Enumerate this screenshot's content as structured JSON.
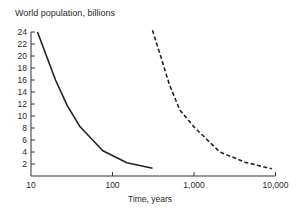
{
  "chart_data": {
    "type": "line",
    "title": "World population, billions",
    "xlabel": "Time, years",
    "ylabel": "World population, billions",
    "xscale": "log",
    "xlim": [
      10,
      10000
    ],
    "ylim": [
      0,
      24
    ],
    "xticks": [
      10,
      100,
      1000,
      10000
    ],
    "xtick_labels": [
      "10",
      "100",
      "1,000",
      "10,000"
    ],
    "yticks": [
      2,
      4,
      6,
      8,
      10,
      12,
      14,
      16,
      18,
      20,
      22,
      24
    ],
    "ytick_labels": [
      "2",
      "4",
      "6",
      "8",
      "10",
      "12",
      "14",
      "16",
      "18",
      "20",
      "22",
      "24"
    ],
    "grid": false,
    "legend": null,
    "series": [
      {
        "name": "solid",
        "style": "solid",
        "color": "#222222",
        "x": [
          12,
          20,
          28,
          40,
          76,
          150,
          310
        ],
        "y": [
          24,
          16,
          11.7,
          8.2,
          4.2,
          2.2,
          1.3
        ]
      },
      {
        "name": "dashed",
        "style": "dashed",
        "color": "#222222",
        "x": [
          310,
          500,
          670,
          1030,
          2080,
          4200,
          9000
        ],
        "y": [
          24.3,
          15.2,
          11,
          8,
          4,
          2.3,
          1.2
        ]
      }
    ]
  }
}
